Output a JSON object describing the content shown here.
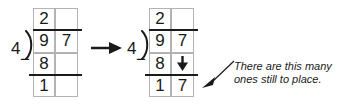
{
  "worksheet": {
    "title": "Long division partial-quotient step",
    "ink_color": "#1a1a1a",
    "gridline_color": "#b3b3b3",
    "background": "#ffffff"
  },
  "problems": [
    {
      "id": "before",
      "divisor": "4",
      "bracket_glyph": ")",
      "quotient_row": [
        "2",
        ""
      ],
      "dividend_row": [
        "9",
        "7"
      ],
      "subtract_sign": "−",
      "subtract_row": [
        "8",
        ""
      ],
      "remainder_row": [
        "1",
        ""
      ],
      "bring_down_arrow": false
    },
    {
      "id": "after",
      "divisor": "4",
      "bracket_glyph": ")",
      "quotient_row": [
        "2",
        ""
      ],
      "dividend_row": [
        "9",
        "7"
      ],
      "subtract_sign": "−",
      "subtract_row": [
        "8",
        "bring-down-arrow"
      ],
      "remainder_row": [
        "1",
        "7"
      ],
      "bring_down_arrow": true
    }
  ],
  "transition": {
    "icon": "right-arrow-icon",
    "label": "→"
  },
  "callout": {
    "line1": "There are this many",
    "line2": "ones still to place.",
    "pointer_icon": "triangle-pointer-icon"
  }
}
